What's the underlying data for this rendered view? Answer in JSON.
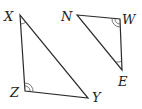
{
  "diagram": {
    "type": "geometry-triangles",
    "colors": {
      "stroke": "#2a2a2a",
      "label": "#222222",
      "background": "#ffffff"
    },
    "triangles": [
      {
        "name": "XZY",
        "vertices": {
          "X": {
            "label": "X",
            "x": 20,
            "y": 15
          },
          "Z": {
            "label": "Z",
            "x": 25,
            "y": 91
          },
          "Y": {
            "label": "Y",
            "x": 88,
            "y": 98
          }
        },
        "angle_marks": [
          {
            "vertex": "X",
            "arcs": 1
          },
          {
            "vertex": "Z",
            "arcs": 2
          }
        ]
      },
      {
        "name": "NWE",
        "vertices": {
          "N": {
            "label": "N",
            "x": 77,
            "y": 15
          },
          "W": {
            "label": "W",
            "x": 120,
            "y": 19
          },
          "E": {
            "label": "E",
            "x": 122,
            "y": 70
          }
        },
        "angle_marks": [
          {
            "vertex": "W",
            "arcs": 2
          },
          {
            "vertex": "E",
            "arcs": 1
          }
        ]
      }
    ],
    "labels": {
      "X": "X",
      "Z": "Z",
      "Y": "Y",
      "N": "N",
      "W": "W",
      "E": "E"
    }
  }
}
